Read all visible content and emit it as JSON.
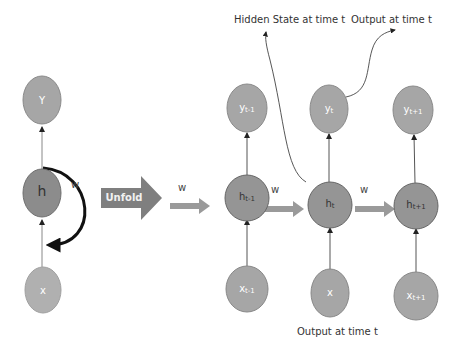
{
  "diagram": {
    "colors": {
      "node_fill": "#a6a6a6",
      "hidden_node_fill": "#8c8c8c",
      "node_stroke": "#7a7a7a",
      "arrow_fill": "#999999",
      "unfold_fill": "#7f7f7f",
      "line": "#444444"
    },
    "folded": {
      "output_node": "Y",
      "hidden_node": "h",
      "input_node": "x",
      "recurrent_weight": "w"
    },
    "unfold_label": "Unfold",
    "unrolled": {
      "weights": [
        "w",
        "w",
        "w"
      ],
      "steps": [
        {
          "output": "y",
          "output_sub": "t-1",
          "hidden": "h",
          "hidden_sub": "t-1",
          "input": "x",
          "input_sub": "t-1"
        },
        {
          "output": "y",
          "output_sub": "t",
          "hidden": "h",
          "hidden_sub": "t",
          "input": "x",
          "input_sub": ""
        },
        {
          "output": "y",
          "output_sub": "t+1",
          "hidden": "h",
          "hidden_sub": "t+1",
          "input": "x",
          "input_sub": "t+1"
        }
      ]
    },
    "annotations": {
      "hidden_state": "Hidden State at time t",
      "output_top": "Output at time t",
      "output_bottom": "Output at time t"
    }
  }
}
